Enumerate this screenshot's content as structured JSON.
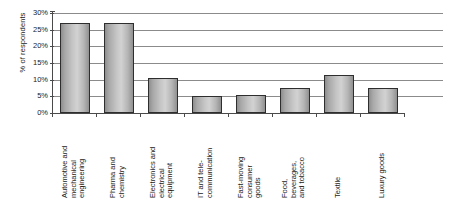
{
  "chart_data": {
    "type": "bar",
    "title": "",
    "subtitle": "",
    "xlabel": "",
    "ylabel": "% of respondents",
    "ylim": [
      0,
      30
    ],
    "ytick_labels": [
      "30%",
      "25%",
      "20%",
      "15%",
      "10%",
      "5%",
      "0%"
    ],
    "ytick_values": [
      30,
      25,
      20,
      15,
      10,
      5,
      0
    ],
    "grid": "horizontal",
    "legend": "none",
    "categories": [
      "Automotive and mechanical engineering",
      "Pharma and chemistry",
      "Electronics and electrical equipment",
      "IT and tele-communication",
      "Fast-moving consumer goods",
      "Food, beverages, and tobacco",
      "Textile",
      "Luxury goods"
    ],
    "category_lines": [
      [
        "Automotive and",
        "mechanical",
        "engineering"
      ],
      [
        "Pharma and",
        "chemistry"
      ],
      [
        "Electronics and",
        "electrical",
        "equipment"
      ],
      [
        "IT and tele-",
        "communication"
      ],
      [
        "Fast-moving",
        "consumer",
        "goods"
      ],
      [
        "Food,",
        "beverages,",
        "and tobacco"
      ],
      [
        "Textile"
      ],
      [
        "Luxury goods"
      ]
    ],
    "values": [
      27,
      27,
      10.5,
      5,
      5.5,
      7.5,
      11.5,
      7.5
    ],
    "value_labels": [
      "27%",
      "27%",
      "10.5%",
      "5%",
      "5.5%",
      "7.5%",
      "11.5%",
      "7.5%"
    ],
    "colors": {
      "bar_fill_light": "#d2d2d2",
      "bar_fill_dark": "#8e8e8e",
      "bar_border": "#2e2e2e",
      "gridline": "#8b8b8b",
      "axis": "#4a4a4a",
      "text": "#1a1a1a",
      "background": "#ffffff"
    }
  }
}
